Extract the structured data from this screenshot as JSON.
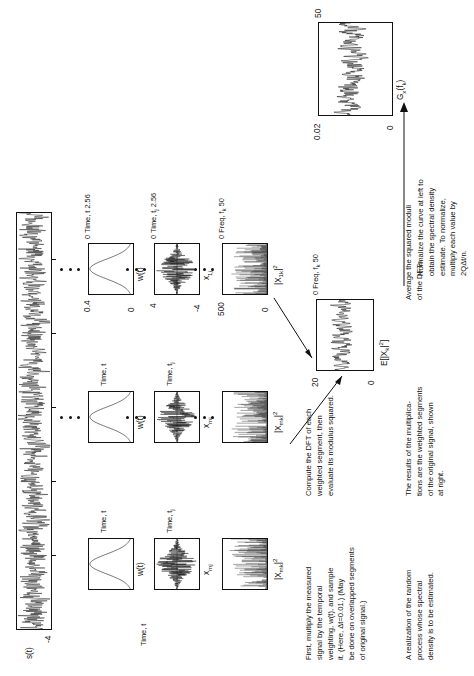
{
  "figure": {
    "orientation_note": "rotated"
  },
  "panels": {
    "signal": {
      "name": "s(t)",
      "ylabel": "s(t)",
      "ytick_min": "-4",
      "xlabel": "Time, t"
    },
    "window": {
      "ylabel": "w(t)",
      "ytick_max": "0.4",
      "ytick_min": "0",
      "xlabel": "Time, t",
      "xtick_min": "0",
      "xtick_max": "2.56"
    },
    "weighted": {
      "ylabel_base": "x",
      "ylabel_sub": "1j",
      "ytick_max": "4",
      "ytick_min": "-4",
      "xlabel": "Time, t",
      "xlabel_sub": "j",
      "xtick_min": "0",
      "xtick_max": "2.56"
    },
    "dft": {
      "ylabel_base": "|X",
      "ylabel_sub": "1k",
      "ylabel_sup": "2",
      "ytick_max": "500",
      "ytick_min": "0",
      "xlabel": "Freq, f",
      "xlabel_sub": "k",
      "xtick_min": "0",
      "xtick_max": "50"
    },
    "weighted_m": {
      "ylabel_base": "x",
      "ylabel_sub": "mj",
      "xlabel": "Time, t"
    },
    "window_m": {
      "ylabel": "w(t)",
      "xlabel": "Time, t"
    },
    "dft_m": {
      "ylabel_base": "|X",
      "ylabel_sub": "mk",
      "ylabel_sup": "2",
      "xlabel": "Time, t",
      "xlabel_sub": "j"
    },
    "average": {
      "ylabel_base": "E[|X",
      "ylabel_sub": "k",
      "ylabel_sup": "2",
      "ylabel_tail": "]",
      "ytick_max": "20",
      "ytick_min": "0",
      "xlabel": "Freq, f",
      "xlabel_sub": "k",
      "xtick_min": "0",
      "xtick_max": "50"
    },
    "spectral": {
      "ylabel_base": "G",
      "ylabel_sub": "x",
      "ylabel_arg": "(f",
      "ylabel_arg_sub": "k",
      "ylabel_arg_tail": ")",
      "ytick_max": "0.02",
      "ytick_min": "0",
      "xtick_min": "0",
      "xtick_max": "50"
    }
  },
  "captions": {
    "realization": "A realization of the random\nprocess whose spectral\ndensity is to be estimated.",
    "multiply": "First, multiply the measured\nsignal by the temporal\nweighting, w(t), and sample\nit. (Here, Δt=0.01.) (May\nbe done on overlapped segments\nof original signal.)",
    "results": "The results of the multiplica-\ntions are the weighted segments\nof the original signal, shown\nat right.",
    "dft": "Compute the DFT of each\nweighted segment, then\nevaluate its modulus squared.",
    "average": "Average the squared moduli\nof the DFTs.",
    "normalize": "Normalize the curve at left to\nobtain the spectral density\nestimate.  To normalize,\nmultiply each value by\n2QΔt/n."
  },
  "chart_data": {
    "type": "line",
    "series": [
      {
        "name": "s(t) realization",
        "ylim": [
          -4,
          4
        ],
        "xlabel": "Time, t"
      },
      {
        "name": "w(t) window",
        "ylim": [
          0,
          0.4
        ],
        "xlim": [
          0,
          2.56
        ],
        "xlabel": "Time, t"
      },
      {
        "name": "x_1j weighted segment",
        "ylim": [
          -4,
          4
        ],
        "xlim": [
          0,
          2.56
        ],
        "xlabel": "Time, t_j"
      },
      {
        "name": "|X_1k|^2 periodogram",
        "ylim": [
          0,
          500
        ],
        "xlim": [
          0,
          50
        ],
        "xlabel": "Freq, f_k"
      },
      {
        "name": "E[|X_k|^2] average",
        "ylim": [
          0,
          20
        ],
        "xlim": [
          0,
          50
        ],
        "xlabel": "Freq, f_k"
      },
      {
        "name": "G_x(f_k) spectral density",
        "ylim": [
          0,
          0.02
        ],
        "xlim": [
          0,
          50
        ],
        "xlabel": "Freq, f_k"
      }
    ],
    "grid": false,
    "legend": "none"
  }
}
